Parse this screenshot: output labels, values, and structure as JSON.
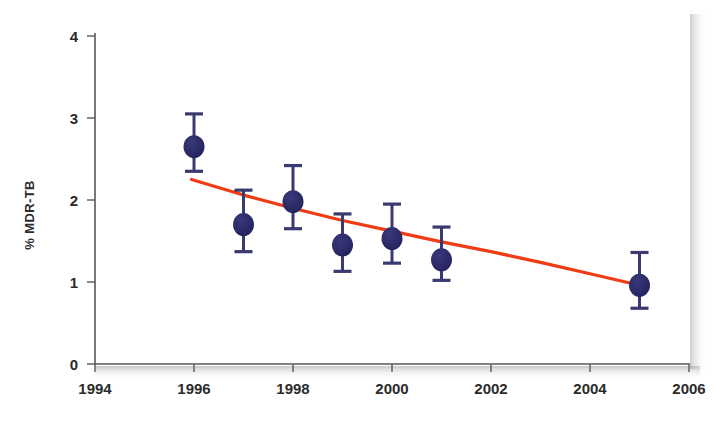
{
  "chart_data": {
    "type": "scatter",
    "title": "",
    "subtitle": "",
    "xlabel": "",
    "ylabel": "% MDR-TB",
    "xlim": [
      1994,
      2006
    ],
    "ylim": [
      0,
      4
    ],
    "grid": false,
    "legend": false,
    "legend_position": "none",
    "x_ticks": [
      1994,
      1996,
      1998,
      2000,
      2002,
      2004,
      2006
    ],
    "x_tick_labels": [
      "1994",
      "1996",
      "1998",
      "2000",
      "2002",
      "2004",
      "2006"
    ],
    "y_ticks": [
      0,
      1,
      2,
      3,
      4
    ],
    "y_tick_labels": [
      "0",
      "1",
      "2",
      "3",
      "4"
    ],
    "marker_color": "#2b2a66",
    "errorbar_color": "#3b3a70",
    "trend_color": "#f03c14",
    "axis_color": "#58585a",
    "series": [
      {
        "name": "% MDR-TB observed",
        "type": "scatter-errorbar",
        "x": [
          1996,
          1997,
          1998,
          1999,
          2000,
          2001,
          2005
        ],
        "values": [
          2.65,
          1.7,
          1.98,
          1.45,
          1.53,
          1.27,
          0.96
        ],
        "err_low": [
          2.35,
          1.37,
          1.65,
          1.13,
          1.23,
          1.02,
          0.68
        ],
        "err_high": [
          3.05,
          2.12,
          2.42,
          1.83,
          1.95,
          1.67,
          1.36
        ]
      },
      {
        "name": "fitted trend",
        "type": "line",
        "x": [
          1995.95,
          1997,
          1998,
          1999,
          2000,
          2001,
          2002,
          2003,
          2004,
          2005
        ],
        "values": [
          2.25,
          2.06,
          1.9,
          1.75,
          1.62,
          1.49,
          1.37,
          1.24,
          1.1,
          0.96
        ]
      }
    ],
    "annotations": []
  },
  "axes": {
    "y_axis_title": "% MDR-TB"
  }
}
